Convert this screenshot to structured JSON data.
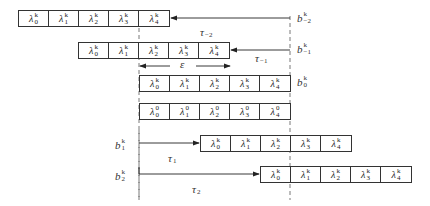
{
  "diagram": {
    "rows": [
      {
        "id": "row-minus2",
        "x": 18,
        "y": 10,
        "cells": [
          {
            "base": "λ",
            "sub": "0",
            "sup": "k"
          },
          {
            "base": "λ",
            "sub": "1",
            "sup": "k"
          },
          {
            "base": "λ",
            "sub": "2",
            "sup": "k"
          },
          {
            "base": "λ",
            "sub": "3",
            "sup": "k"
          },
          {
            "base": "λ",
            "sub": "4",
            "sup": "k"
          }
        ]
      },
      {
        "id": "row-minus1",
        "x": 78,
        "y": 42,
        "cells": [
          {
            "base": "λ",
            "sub": "0",
            "sup": "k"
          },
          {
            "base": "λ",
            "sub": "1",
            "sup": "k"
          },
          {
            "base": "λ",
            "sub": "2",
            "sup": "k"
          },
          {
            "base": "λ",
            "sub": "3",
            "sup": "k"
          },
          {
            "base": "λ",
            "sub": "4",
            "sup": "k"
          }
        ]
      },
      {
        "id": "row-0",
        "x": 139,
        "y": 75,
        "cells": [
          {
            "base": "λ",
            "sub": "0",
            "sup": "k"
          },
          {
            "base": "λ",
            "sub": "1",
            "sup": "k"
          },
          {
            "base": "λ",
            "sub": "2",
            "sup": "k"
          },
          {
            "base": "λ",
            "sub": "3",
            "sup": "k"
          },
          {
            "base": "λ",
            "sub": "4",
            "sup": "k"
          }
        ]
      },
      {
        "id": "row-reference",
        "x": 139,
        "y": 103,
        "cells": [
          {
            "base": "λ",
            "sub": "0",
            "sup": "0"
          },
          {
            "base": "λ",
            "sub": "1",
            "sup": "0"
          },
          {
            "base": "λ",
            "sub": "2",
            "sup": "0"
          },
          {
            "base": "λ",
            "sub": "3",
            "sup": "0"
          },
          {
            "base": "λ",
            "sub": "4",
            "sup": "0"
          }
        ]
      },
      {
        "id": "row-1",
        "x": 200,
        "y": 135,
        "cells": [
          {
            "base": "λ",
            "sub": "0",
            "sup": "k"
          },
          {
            "base": "λ",
            "sub": "1",
            "sup": "k"
          },
          {
            "base": "λ",
            "sub": "2",
            "sup": "k"
          },
          {
            "base": "λ",
            "sub": "3",
            "sup": "k"
          },
          {
            "base": "λ",
            "sub": "4",
            "sup": "k"
          }
        ]
      },
      {
        "id": "row-2",
        "x": 260,
        "y": 166,
        "cells": [
          {
            "base": "λ",
            "sub": "0",
            "sup": "k"
          },
          {
            "base": "λ",
            "sub": "1",
            "sup": "k"
          },
          {
            "base": "λ",
            "sub": "2",
            "sup": "k"
          },
          {
            "base": "λ",
            "sub": "3",
            "sup": "k"
          },
          {
            "base": "λ",
            "sub": "4",
            "sup": "k"
          }
        ]
      }
    ],
    "boundary_labels": [
      {
        "id": "b-minus2",
        "base": "b",
        "sub": "−2",
        "sup": "k",
        "x": 297,
        "y": 11
      },
      {
        "id": "b-minus1",
        "base": "b",
        "sub": "−1",
        "sup": "k",
        "x": 297,
        "y": 42
      },
      {
        "id": "b-0",
        "base": "b",
        "sub": "0",
        "sup": "k",
        "x": 297,
        "y": 75
      },
      {
        "id": "b-1",
        "base": "b",
        "sub": "1",
        "sup": "k",
        "x": 115,
        "y": 138
      },
      {
        "id": "b-2",
        "base": "b",
        "sub": "2",
        "sup": "k",
        "x": 115,
        "y": 169
      }
    ],
    "delay_labels": [
      {
        "id": "tau-minus2",
        "base": "τ",
        "sub": "−2",
        "x": 200,
        "y": 25
      },
      {
        "id": "tau-minus1",
        "base": "τ",
        "sub": "−1",
        "x": 255,
        "y": 51
      },
      {
        "id": "tau-1",
        "base": "τ",
        "sub": "1",
        "x": 168,
        "y": 151
      },
      {
        "id": "tau-2",
        "base": "τ",
        "sub": "2",
        "x": 192,
        "y": 182
      }
    ],
    "epsilon_label": {
      "base": "ε",
      "x": 180,
      "y": 58
    }
  }
}
